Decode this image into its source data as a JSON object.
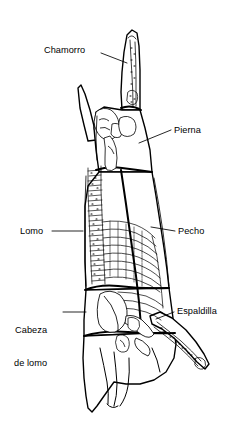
{
  "figure": {
    "kind": "anatomical-line-drawing",
    "language": "es",
    "stroke_color": "#000000",
    "background_color": "#ffffff",
    "bone_fill_color": "#ffffff",
    "line_width_outline": 1.4,
    "line_width_division": 1.9,
    "line_width_detail": 0.7,
    "line_width_leader": 0.8
  },
  "labels": [
    {
      "id": "chamorro",
      "text": "Chamorro",
      "align": "left",
      "x": 44,
      "y": 45,
      "leader": {
        "x1": 101,
        "y1": 53,
        "x2": 125,
        "y2": 62
      }
    },
    {
      "id": "pierna",
      "text": "Pierna",
      "align": "right",
      "x": 174,
      "y": 125,
      "leader": {
        "x1": 171,
        "y1": 130,
        "x2": 138,
        "y2": 143
      }
    },
    {
      "id": "lomo",
      "text": "Lomo",
      "align": "left",
      "x": 20,
      "y": 226,
      "leader": {
        "x1": 52,
        "y1": 231,
        "x2": 82,
        "y2": 231
      }
    },
    {
      "id": "pecho",
      "text": "Pecho",
      "align": "right",
      "x": 178,
      "y": 226,
      "leader": {
        "x1": 175,
        "y1": 231,
        "x2": 150,
        "y2": 227
      }
    },
    {
      "id": "cabeza-de-lomo",
      "text": "Cabeza\nde lomo",
      "line1": "Cabeza",
      "line2": "de lomo",
      "align": "left",
      "x": 14,
      "y": 303,
      "leader": {
        "x1": 63,
        "y1": 312,
        "x2": 85,
        "y2": 312
      }
    },
    {
      "id": "espaldilla",
      "text": "Espaldilla",
      "align": "right",
      "x": 177,
      "y": 306,
      "leader": {
        "x1": 174,
        "y1": 312,
        "x2": 155,
        "y2": 318
      }
    }
  ],
  "cuts": [
    {
      "id": "chamorro",
      "name": "Chamorro"
    },
    {
      "id": "pierna",
      "name": "Pierna"
    },
    {
      "id": "lomo",
      "name": "Lomo"
    },
    {
      "id": "pecho",
      "name": "Pecho"
    },
    {
      "id": "cabeza-de-lomo",
      "name": "Cabeza de lomo"
    },
    {
      "id": "espaldilla",
      "name": "Espaldilla"
    }
  ]
}
